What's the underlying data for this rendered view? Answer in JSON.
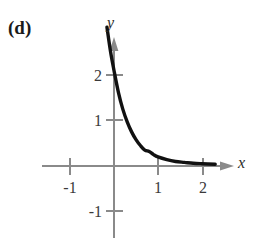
{
  "figure": {
    "panel_label": "(d)",
    "axis_labels": {
      "x": "x",
      "y": "y"
    },
    "colors": {
      "background": "#ffffff",
      "axis": "#8a8a8a",
      "curve": "#111111",
      "text": "#2b2b2b"
    }
  },
  "chart_data": {
    "type": "line",
    "title": "",
    "subtitle": "",
    "xlabel": "x",
    "ylabel": "y",
    "xlim": [
      -1.6,
      2.6
    ],
    "ylim": [
      -1.6,
      2.6
    ],
    "grid": false,
    "legend": null,
    "annotations": [
      {
        "text": "(d)",
        "position": "top-left"
      }
    ],
    "xticks": [
      -1,
      1,
      2
    ],
    "xticklabels": [
      "-1",
      "1",
      "2"
    ],
    "yticks": [
      2,
      1,
      -1
    ],
    "yticklabels": [
      "2",
      "1",
      "-1"
    ],
    "series": [
      {
        "name": "exponential decay",
        "x": [
          -0.16,
          -0.08,
          0.0,
          0.1,
          0.2,
          0.3,
          0.4,
          0.5,
          0.6,
          0.7,
          0.8,
          0.9,
          1.0,
          1.2,
          1.4,
          1.6,
          1.8,
          2.0,
          2.3
        ],
        "y": [
          3.05,
          2.52,
          2.1,
          1.62,
          1.25,
          0.97,
          0.75,
          0.58,
          0.45,
          0.35,
          0.32,
          0.25,
          0.2,
          0.14,
          0.1,
          0.08,
          0.06,
          0.05,
          0.04
        ]
      }
    ]
  },
  "tick_labels": {
    "x_neg1": "-1",
    "x_1": "1",
    "x_2": "2",
    "y_2": "2",
    "y_1": "1",
    "y_neg1": "-1"
  }
}
